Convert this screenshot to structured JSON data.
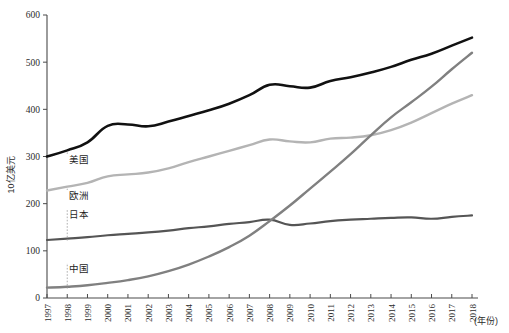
{
  "chart_data": {
    "type": "line",
    "title": "",
    "subtitle": "",
    "xlabel": "(年份)",
    "ylabel": "10亿美元",
    "xlim": [
      1997,
      2018
    ],
    "ylim": [
      0,
      600
    ],
    "grid": false,
    "legend_position": "inline-labels",
    "yticks": [
      0,
      100,
      200,
      300,
      400,
      500,
      600
    ],
    "ytick_labels": [
      "0",
      "100",
      "200",
      "300",
      "400",
      "500",
      "600"
    ],
    "x": [
      1997,
      1998,
      1999,
      2000,
      2001,
      2002,
      2003,
      2004,
      2005,
      2006,
      2007,
      2008,
      2009,
      2010,
      2011,
      2012,
      2013,
      2014,
      2015,
      2016,
      2017,
      2018
    ],
    "categories": [
      "1997",
      "1998",
      "1999",
      "2000",
      "2001",
      "2002",
      "2003",
      "2004",
      "2005",
      "2006",
      "2007",
      "2008",
      "2009",
      "2010",
      "2011",
      "2012",
      "2013",
      "2014",
      "2015",
      "2016",
      "2017",
      "2018"
    ],
    "series": [
      {
        "name": "美国",
        "label": "美国",
        "color": "#111111",
        "values": [
          300,
          313,
          330,
          365,
          368,
          364,
          374,
          386,
          398,
          412,
          430,
          452,
          449,
          446,
          460,
          468,
          478,
          490,
          505,
          518,
          535,
          552
        ]
      },
      {
        "name": "欧洲",
        "label": "欧洲",
        "color": "#b4b4b4",
        "values": [
          228,
          236,
          244,
          258,
          262,
          266,
          275,
          288,
          300,
          312,
          324,
          336,
          332,
          330,
          338,
          340,
          345,
          356,
          372,
          392,
          412,
          430
        ]
      },
      {
        "name": "日本",
        "label": "日本",
        "color": "#555555",
        "values": [
          123,
          126,
          129,
          133,
          136,
          139,
          143,
          148,
          152,
          157,
          161,
          166,
          155,
          158,
          163,
          166,
          168,
          170,
          171,
          168,
          172,
          175
        ]
      },
      {
        "name": "中国",
        "label": "中国",
        "color": "#808080",
        "values": [
          22,
          24,
          27,
          32,
          38,
          46,
          57,
          71,
          88,
          108,
          132,
          163,
          196,
          232,
          268,
          305,
          345,
          383,
          415,
          448,
          485,
          520
        ]
      }
    ],
    "annotations": [
      {
        "text": "美国",
        "series": "美国",
        "at_year": 1998
      },
      {
        "text": "欧洲",
        "series": "欧洲",
        "at_year": 1998
      },
      {
        "text": "日本",
        "series": "日本",
        "at_year": 1998
      },
      {
        "text": "中国",
        "series": "中国",
        "at_year": 1998
      }
    ]
  }
}
